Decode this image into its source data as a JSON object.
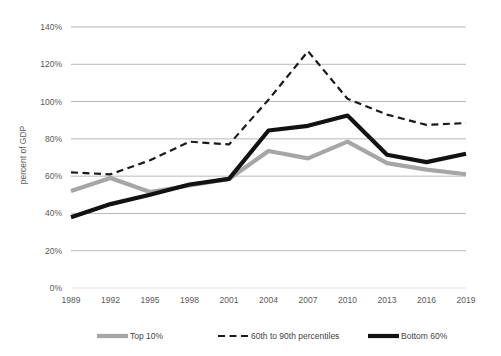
{
  "chart_data": {
    "type": "line",
    "title": "",
    "subtitle": "",
    "xlabel": "",
    "ylabel": "percent of GDP",
    "categories": [
      "1989",
      "1992",
      "1995",
      "1998",
      "2001",
      "2004",
      "2007",
      "2010",
      "2013",
      "2016",
      "2019"
    ],
    "x": [
      1989,
      1992,
      1995,
      1998,
      2001,
      2004,
      2007,
      2010,
      2013,
      2016,
      2019
    ],
    "ylim": [
      0,
      140
    ],
    "ytick_values": [
      0,
      20,
      40,
      60,
      80,
      100,
      120,
      140
    ],
    "ytick_labels": [
      "0%",
      "20%",
      "40%",
      "60%",
      "80%",
      "100%",
      "120%",
      "140%"
    ],
    "grid": "horizontal",
    "legend_position": "bottom",
    "series": [
      {
        "name": "Top 10%",
        "style": "solid",
        "color": "#a6a6a6",
        "values": [
          52,
          59,
          51.5,
          55,
          58.5,
          73.5,
          69.5,
          78.5,
          67,
          63.5,
          61
        ]
      },
      {
        "name": "60th to 90th percentiles",
        "style": "dashed",
        "color": "#1a1a1a",
        "values": [
          62,
          61,
          68.5,
          78.5,
          77,
          101,
          127,
          101.5,
          93,
          87.5,
          88.5
        ]
      },
      {
        "name": "Bottom 60%",
        "style": "solid",
        "color": "#121212",
        "values": [
          38,
          45,
          50,
          55.5,
          58.5,
          84.5,
          87,
          92.5,
          71.5,
          67.5,
          72
        ]
      }
    ]
  },
  "axes": {
    "y_title": "percent of GDP",
    "y_ticks": [
      "140%",
      "120%",
      "100%",
      "80%",
      "60%",
      "40%",
      "20%",
      "0%"
    ],
    "x_ticks": [
      "1989",
      "1992",
      "1995",
      "1998",
      "2001",
      "2004",
      "2007",
      "2010",
      "2013",
      "2016",
      "2019"
    ]
  },
  "legend": {
    "items": [
      {
        "label": "Top 10%"
      },
      {
        "label": "60th to 90th percentiles"
      },
      {
        "label": "Bottom 60%"
      }
    ]
  },
  "colors": {
    "background": "#ffffff",
    "gridline": "#a6a6a6",
    "axis_text": "#595959",
    "legend_text": "#3f3f3f",
    "top10": "#a6a6a6",
    "mid": "#1a1a1a",
    "bottom": "#121212"
  }
}
